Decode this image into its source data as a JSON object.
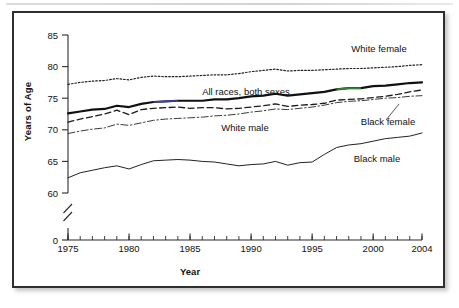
{
  "chart_data": {
    "type": "line",
    "title": "",
    "xlabel": "Year",
    "ylabel": "Years of Age",
    "xlim": [
      1975,
      2004
    ],
    "ylim": [
      58,
      85
    ],
    "yticks": [
      0,
      60,
      65,
      70,
      75,
      80,
      85
    ],
    "ytick_labels": [
      "0",
      "60",
      "65",
      "70",
      "75",
      "80",
      "85"
    ],
    "y_axis_break": true,
    "xticks": [
      1975,
      1980,
      1985,
      1990,
      1995,
      2000,
      2004
    ],
    "xtick_labels": [
      "1975",
      "1980",
      "1985",
      "1990",
      "1995",
      "2000",
      "2004"
    ],
    "x_minor_tick_step": 1,
    "grid": false,
    "legend_position": "inline-annotations",
    "x": [
      1975,
      1976,
      1977,
      1978,
      1979,
      1980,
      1981,
      1982,
      1983,
      1984,
      1985,
      1986,
      1987,
      1988,
      1989,
      1990,
      1991,
      1992,
      1993,
      1994,
      1995,
      1996,
      1997,
      1998,
      1999,
      2000,
      2001,
      2002,
      2003,
      2004
    ],
    "series": [
      {
        "name": "White female",
        "style": "dotted",
        "color": "#222222",
        "values": [
          77.2,
          77.5,
          77.7,
          77.8,
          78.1,
          77.9,
          78.3,
          78.5,
          78.4,
          78.4,
          78.5,
          78.6,
          78.7,
          78.7,
          78.9,
          79.2,
          79.4,
          79.6,
          79.3,
          79.4,
          79.4,
          79.5,
          79.6,
          79.7,
          79.7,
          79.8,
          79.9,
          80.0,
          80.2,
          80.3
        ]
      },
      {
        "name": "All races, both sexes",
        "style": "solid-thick",
        "color": "#111111",
        "values": [
          72.6,
          72.9,
          73.2,
          73.3,
          73.8,
          73.6,
          74.1,
          74.4,
          74.5,
          74.6,
          74.6,
          74.6,
          74.8,
          74.8,
          75.0,
          75.3,
          75.4,
          75.7,
          75.4,
          75.6,
          75.8,
          76.0,
          76.4,
          76.6,
          76.6,
          76.9,
          77.0,
          77.2,
          77.4,
          77.5
        ]
      },
      {
        "name": "Black female",
        "style": "dashed",
        "color": "#1b1b1b",
        "values": [
          71.2,
          71.7,
          72.1,
          72.5,
          73.1,
          72.4,
          73.2,
          73.4,
          73.5,
          73.6,
          73.4,
          73.5,
          73.5,
          73.3,
          73.4,
          73.6,
          73.8,
          74.1,
          73.7,
          73.9,
          74.0,
          74.2,
          74.7,
          74.8,
          74.9,
          75.1,
          75.3,
          75.6,
          76.0,
          76.3
        ]
      },
      {
        "name": "White male",
        "style": "dash-dot",
        "color": "#3a3a3a",
        "values": [
          69.4,
          69.8,
          70.1,
          70.3,
          70.9,
          70.7,
          71.1,
          71.5,
          71.7,
          71.8,
          71.9,
          72.0,
          72.2,
          72.3,
          72.5,
          72.8,
          73.0,
          73.3,
          73.2,
          73.4,
          73.6,
          73.9,
          74.3,
          74.5,
          74.6,
          74.8,
          75.0,
          75.1,
          75.3,
          75.4
        ]
      },
      {
        "name": "Black male",
        "style": "solid-thin",
        "color": "#222222",
        "values": [
          62.4,
          63.2,
          63.6,
          64.0,
          64.3,
          63.8,
          64.5,
          65.1,
          65.2,
          65.3,
          65.2,
          65.0,
          64.9,
          64.6,
          64.3,
          64.5,
          64.6,
          65.0,
          64.4,
          64.8,
          64.9,
          66.1,
          67.2,
          67.6,
          67.8,
          68.2,
          68.6,
          68.8,
          69.0,
          69.5
        ]
      }
    ],
    "annotations": [
      {
        "label": "White female",
        "x": 379,
        "y": 52
      },
      {
        "label": "All races, both sexes",
        "x": 246,
        "y": 95
      },
      {
        "label": "Black female",
        "x": 388,
        "y": 125
      },
      {
        "label": "White male",
        "x": 245,
        "y": 131
      },
      {
        "label": "Black male",
        "x": 377,
        "y": 162
      }
    ]
  }
}
